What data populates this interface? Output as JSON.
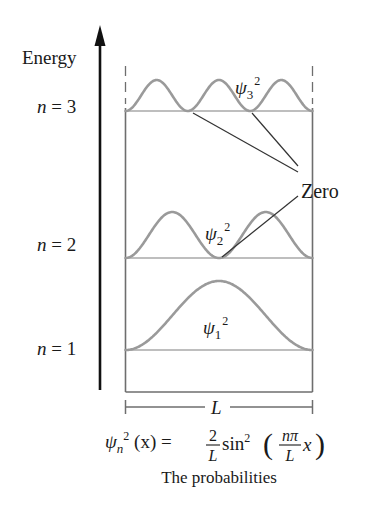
{
  "diagram": {
    "axis_label": "Energy",
    "levels": [
      {
        "n": 3,
        "label_prefix": "n",
        "label_eq": " = ",
        "label_value": "3",
        "curve_label": "ψ",
        "curve_sub": "3",
        "curve_sup": "2"
      },
      {
        "n": 2,
        "label_prefix": "n",
        "label_eq": " = ",
        "label_value": "2",
        "curve_label": "ψ",
        "curve_sub": "2",
        "curve_sup": "2"
      },
      {
        "n": 1,
        "label_prefix": "n",
        "label_eq": " = ",
        "label_value": "1",
        "curve_label": "ψ",
        "curve_sub": "1",
        "curve_sup": "2"
      }
    ],
    "annotation": "Zero",
    "width_label": "L",
    "formula": {
      "lhs_psi": "ψ",
      "lhs_sub": "n",
      "lhs_sup": "2",
      "lhs_arg": " (x) = ",
      "frac1_num": "2",
      "frac1_den": "L",
      "func": "sin",
      "func_sup": "2",
      "open_paren": "(",
      "frac2_num": "nπ",
      "frac2_den": "L",
      "var": "x",
      "close_paren": ")"
    },
    "caption": "The probabilities",
    "colors": {
      "curve": "#9a9a9a",
      "baseline": "#a8a8a8",
      "walls": "#6e6e6e",
      "axis": "#111111",
      "pointer": "#333333"
    }
  }
}
